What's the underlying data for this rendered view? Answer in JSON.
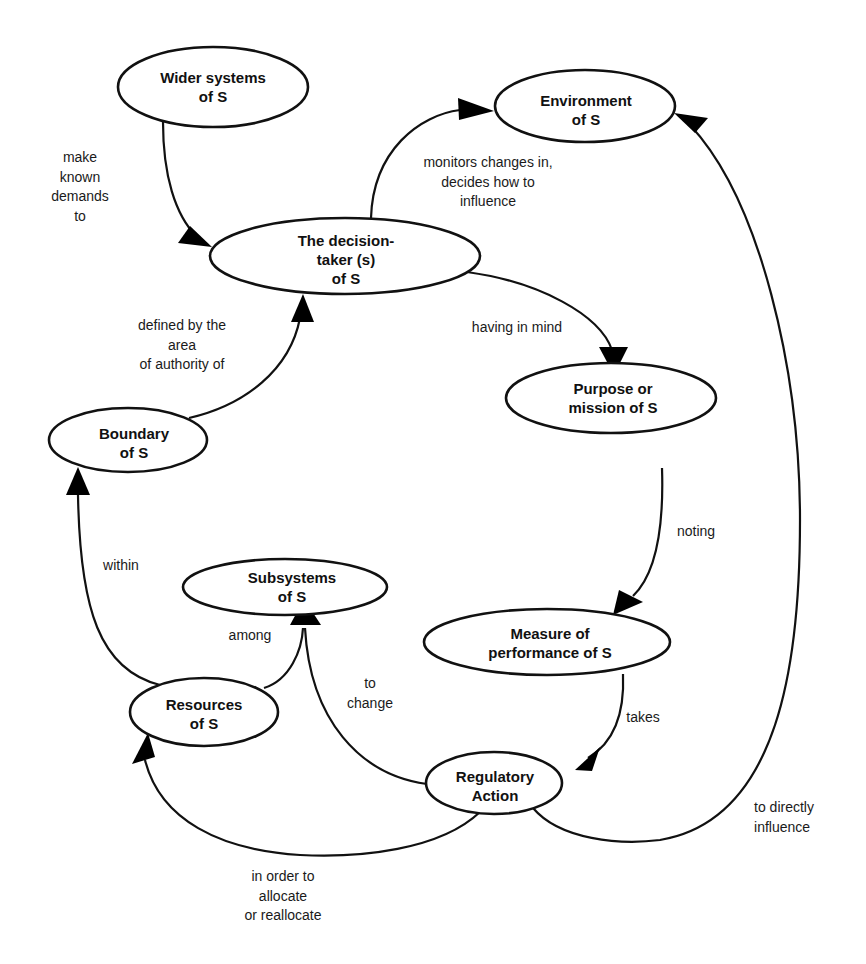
{
  "diagram": {
    "colors": {
      "stroke": "#111111",
      "background": "#ffffff",
      "arrowhead": "#000000"
    },
    "nodes": [
      {
        "id": "wider",
        "label": "Wider systems\nof S",
        "cx": 213,
        "cy": 87,
        "rx": 95,
        "ry": 40
      },
      {
        "id": "environment",
        "label": "Environment\nof S",
        "cx": 585,
        "cy": 106,
        "rx": 90,
        "ry": 36
      },
      {
        "id": "decision",
        "label": "The decision-\ntaker (s)\nof S",
        "cx": 345,
        "cy": 256,
        "rx": 135,
        "ry": 38
      },
      {
        "id": "purpose",
        "label": "Purpose or\nmission of S",
        "cx": 611,
        "cy": 398,
        "rx": 105,
        "ry": 35
      },
      {
        "id": "boundary",
        "label": "Boundary\nof S",
        "cx": 128,
        "cy": 440,
        "rx": 79,
        "ry": 32
      },
      {
        "id": "subsystems",
        "label": "Subsystems\nof S",
        "cx": 285,
        "cy": 587,
        "rx": 102,
        "ry": 28
      },
      {
        "id": "measure",
        "label": "Measure of\nperformance of S",
        "cx": 547,
        "cy": 642,
        "rx": 123,
        "ry": 33
      },
      {
        "id": "resources",
        "label": "Resources\nof S",
        "cx": 204,
        "cy": 712,
        "rx": 74,
        "ry": 34
      },
      {
        "id": "regulatory",
        "label": "Regulatory\nAction",
        "cx": 494,
        "cy": 783,
        "rx": 68,
        "ry": 31
      }
    ],
    "edges": [
      {
        "from": "wider",
        "to": "decision",
        "label": "make\nknown\ndemands\nto",
        "lx": 80,
        "ly": 178
      },
      {
        "from": "decision",
        "to": "environment",
        "label": "monitors changes in,\ndecides how to\ninfluence",
        "lx": 488,
        "ly": 182
      },
      {
        "from": "boundary",
        "to": "decision",
        "label": "defined by the\narea\nof authority of",
        "lx": 182,
        "ly": 343
      },
      {
        "from": "decision",
        "to": "purpose",
        "label": "having in mind",
        "lx": 517,
        "ly": 328
      },
      {
        "from": "purpose",
        "to": "measure",
        "label": "noting",
        "lx": 696,
        "ly": 532
      },
      {
        "from": "resources",
        "to": "boundary",
        "label": "within",
        "lx": 121,
        "ly": 566
      },
      {
        "from": "resources",
        "to": "subsystems",
        "label": "among",
        "lx": 250,
        "ly": 636
      },
      {
        "from": "regulatory",
        "to": "subsystems",
        "label": "to\nchange",
        "lx": 370,
        "ly": 704
      },
      {
        "from": "measure",
        "to": "regulatory",
        "label": "takes",
        "lx": 643,
        "ly": 718
      },
      {
        "from": "regulatory",
        "to": "resources",
        "label": "in order to\nallocate\nor reallocate",
        "lx": 283,
        "ly": 896
      },
      {
        "from": "regulatory",
        "to": "environment",
        "label": "to directly\ninfluence",
        "lx": 786,
        "ly": 817
      }
    ]
  }
}
